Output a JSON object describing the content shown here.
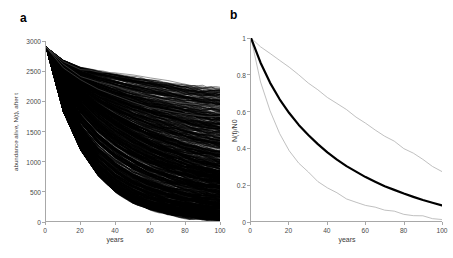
{
  "figure": {
    "background_color": "#ffffff",
    "panels": [
      {
        "label": "a",
        "xlabel": "years",
        "ylabel": "abundance alive, N(t), after t",
        "xticks": [
          "0",
          "20",
          "40",
          "60",
          "80",
          "100"
        ],
        "yticks": [
          "0",
          "500",
          "1000",
          "1500",
          "2000",
          "2500",
          "3000"
        ]
      },
      {
        "label": "b",
        "xlabel": "years",
        "ylabel": "N(t)/N0",
        "xticks": [
          "0",
          "20",
          "40",
          "60",
          "80",
          "100"
        ],
        "yticks": [
          "0",
          "0.2",
          "0.4",
          "0.6",
          "0.8",
          "1"
        ]
      }
    ]
  },
  "chart_data": [
    {
      "type": "line",
      "panel": "a",
      "title": "",
      "xlabel": "years",
      "ylabel": "abundance alive, N(t), after t",
      "xlim": [
        0,
        100
      ],
      "ylim": [
        0,
        3000
      ],
      "xticks": [
        0,
        20,
        40,
        60,
        80,
        100
      ],
      "yticks": [
        0,
        500,
        1000,
        1500,
        2000,
        2500,
        3000
      ],
      "grid": false,
      "legend": "none",
      "description": "Dense spaghetti plot of 1000 stochastic simulation trajectories of abundance alive over 100 years, all starting near 2900 and declining; envelope spans from near 0 to about 2200 at year 100.",
      "n_trajectories": 1000,
      "start_value": 2900,
      "envelope": {
        "x": [
          0,
          10,
          20,
          30,
          40,
          50,
          60,
          70,
          80,
          90,
          100
        ],
        "upper": [
          2900,
          2680,
          2560,
          2500,
          2450,
          2400,
          2350,
          2300,
          2260,
          2220,
          2200
        ],
        "median": [
          2900,
          2400,
          2050,
          1780,
          1560,
          1380,
          1230,
          1110,
          1000,
          910,
          840
        ],
        "lower": [
          2900,
          1820,
          1180,
          760,
          490,
          310,
          200,
          125,
          80,
          48,
          25
        ]
      },
      "series": [
        {
          "name": "upper-outlier-trajectory",
          "x": [
            0,
            10,
            20,
            25,
            30,
            40,
            50,
            60,
            70,
            80,
            90,
            100
          ],
          "values": [
            2900,
            2650,
            2520,
            2510,
            2490,
            2470,
            2440,
            2390,
            2330,
            2270,
            2215,
            2200
          ]
        },
        {
          "name": "secondary-outlier-trajectory",
          "x": [
            0,
            10,
            20,
            30,
            40,
            50,
            60,
            70,
            80,
            90,
            100
          ],
          "values": [
            2900,
            2600,
            2410,
            2320,
            2230,
            2150,
            2070,
            2000,
            1950,
            1930,
            1900
          ]
        },
        {
          "name": "tertiary-outlier-trajectory",
          "x": [
            0,
            10,
            20,
            30,
            40,
            50,
            60,
            70,
            80,
            90,
            100
          ],
          "values": [
            2900,
            2560,
            2340,
            2200,
            2090,
            1990,
            1900,
            1830,
            1780,
            1750,
            1740
          ]
        }
      ]
    },
    {
      "type": "line",
      "panel": "b",
      "title": "",
      "xlabel": "years",
      "ylabel": "N(t)/N0",
      "xlim": [
        0,
        100
      ],
      "ylim": [
        0,
        1
      ],
      "xticks": [
        0,
        20,
        40,
        60,
        80,
        100
      ],
      "yticks": [
        0,
        0.2,
        0.4,
        0.6,
        0.8,
        1
      ],
      "grid": false,
      "legend": "none",
      "description": "Median proportion of initial abundance surviving over time (thick black) with upper and lower bounds (thin gray).",
      "x": [
        0,
        5,
        10,
        15,
        20,
        25,
        30,
        35,
        40,
        45,
        50,
        55,
        60,
        65,
        70,
        75,
        80,
        85,
        90,
        95,
        100
      ],
      "series": [
        {
          "name": "upper-bound",
          "color": "#b0b0b0",
          "linewidth": 0.8,
          "values": [
            1.0,
            0.955,
            0.915,
            0.875,
            0.835,
            0.795,
            0.755,
            0.715,
            0.675,
            0.64,
            0.605,
            0.57,
            0.535,
            0.5,
            0.465,
            0.43,
            0.4,
            0.365,
            0.335,
            0.3,
            0.27
          ]
        },
        {
          "name": "median",
          "color": "#000000",
          "linewidth": 2.2,
          "values": [
            1.0,
            0.865,
            0.755,
            0.665,
            0.59,
            0.525,
            0.47,
            0.42,
            0.375,
            0.335,
            0.3,
            0.27,
            0.24,
            0.215,
            0.19,
            0.17,
            0.15,
            0.132,
            0.115,
            0.1,
            0.085
          ]
        },
        {
          "name": "lower-bound",
          "color": "#b0b0b0",
          "linewidth": 0.8,
          "values": [
            1.0,
            0.76,
            0.6,
            0.48,
            0.39,
            0.32,
            0.265,
            0.22,
            0.183,
            0.152,
            0.126,
            0.105,
            0.088,
            0.073,
            0.06,
            0.049,
            0.04,
            0.032,
            0.025,
            0.017,
            0.008
          ]
        }
      ]
    }
  ]
}
